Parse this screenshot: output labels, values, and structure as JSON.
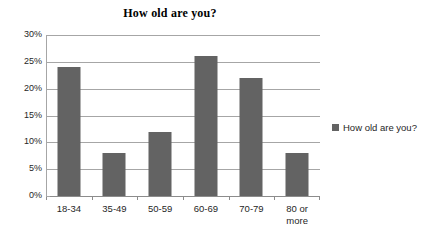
{
  "chart_data": {
    "type": "bar",
    "title": "How old are you?",
    "categories": [
      "18-34",
      "35-49",
      "50-59",
      "60-69",
      "70-79",
      "80 or more"
    ],
    "category_lines": [
      [
        "18-34"
      ],
      [
        "35-49"
      ],
      [
        "50-59"
      ],
      [
        "60-69"
      ],
      [
        "70-79"
      ],
      [
        "80 or",
        "more"
      ]
    ],
    "values": [
      24,
      8,
      12,
      26,
      22,
      8
    ],
    "value_labels": [
      "24%",
      "8%",
      "12%",
      "26%",
      "22%",
      "8%"
    ],
    "series": [
      {
        "name": "How old are you?",
        "values": [
          24,
          8,
          12,
          26,
          22,
          8
        ]
      }
    ],
    "xlabel": "",
    "ylabel": "",
    "ylim": [
      0,
      30
    ],
    "ytick_values": [
      0,
      5,
      10,
      15,
      20,
      25,
      30
    ],
    "ytick_labels": [
      "0%",
      "5%",
      "10%",
      "15%",
      "20%",
      "25%",
      "30%"
    ],
    "grid": true,
    "grid_axis": "y",
    "legend": {
      "position": "right",
      "entries": [
        "How old are you?"
      ]
    },
    "colors": {
      "bar_fill": "#636363",
      "gridline": "#a6a6a6",
      "axis_line": "#8c8c8c",
      "text": "#262626",
      "title_text": "#000000",
      "background": "#ffffff",
      "legend_swatch": "#636363"
    }
  }
}
